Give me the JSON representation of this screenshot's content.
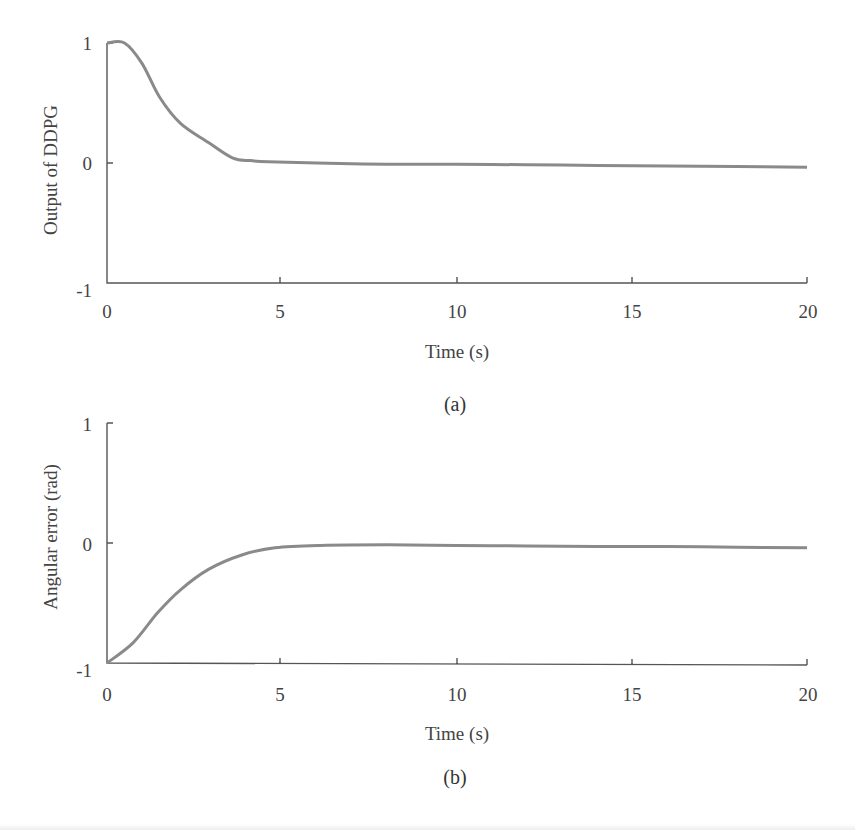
{
  "chart_data": [
    {
      "type": "line",
      "panel": "(a)",
      "title": "",
      "xlabel": "Time (s)",
      "ylabel": "Output of DDPG",
      "xlim": [
        0,
        20
      ],
      "ylim": [
        -1,
        1
      ],
      "xticks": [
        "0",
        "5",
        "10",
        "15",
        "20"
      ],
      "yticks": [
        "-1",
        "0",
        "1"
      ],
      "grid": false,
      "series": [
        {
          "name": "Output of DDPG",
          "color": "#8a8a8a",
          "x": [
            0,
            0.5,
            1.0,
            1.5,
            2.1,
            2.9,
            3.6,
            4.1,
            4.6,
            6,
            8,
            10,
            12,
            14,
            16,
            18,
            20
          ],
          "y": [
            1,
            1,
            0.83,
            0.55,
            0.33,
            0.17,
            0.04,
            0.02,
            0.01,
            0.0,
            -0.01,
            -0.01,
            -0.015,
            -0.02,
            -0.025,
            -0.03,
            -0.035
          ]
        }
      ]
    },
    {
      "type": "line",
      "panel": "(b)",
      "title": "",
      "xlabel": "Time (s)",
      "ylabel": "Angular error (rad)",
      "xlim": [
        0,
        20
      ],
      "ylim": [
        -1,
        1
      ],
      "xticks": [
        "0",
        "5",
        "10",
        "15",
        "20"
      ],
      "yticks": [
        "-1",
        "0",
        "1"
      ],
      "grid": false,
      "series": [
        {
          "name": "Angular error",
          "color": "#8a8a8a",
          "x": [
            0,
            0.75,
            1.45,
            2.1,
            2.9,
            3.85,
            4.8,
            6.1,
            8,
            10,
            12,
            14,
            16,
            18,
            20
          ],
          "y": [
            -1,
            -0.83,
            -0.58,
            -0.39,
            -0.22,
            -0.1,
            -0.04,
            -0.02,
            -0.015,
            -0.02,
            -0.025,
            -0.03,
            -0.03,
            -0.035,
            -0.04
          ]
        }
      ]
    }
  ],
  "figure": {
    "panel_a": {
      "caption": "(a)",
      "xlabel": "Time (s)",
      "ylabel": "Output of DDPG",
      "xticks": [
        "0",
        "5",
        "10",
        "15",
        "20"
      ],
      "yticks": [
        "1",
        "0",
        "-1"
      ]
    },
    "panel_b": {
      "caption": "(b)",
      "xlabel": "Time (s)",
      "ylabel": "Angular error (rad)",
      "xticks": [
        "0",
        "5",
        "10",
        "15",
        "20"
      ],
      "yticks": [
        "1",
        "0",
        "-1"
      ]
    }
  }
}
